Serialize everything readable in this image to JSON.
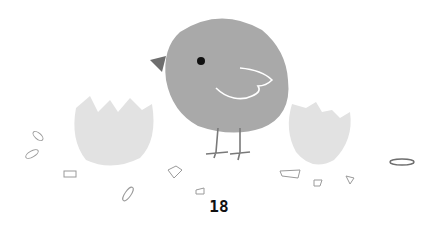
{
  "illustration": {
    "subject": "gray chick with two broken eggshell halves",
    "colors": {
      "chick_body": "#a9a9a9",
      "beak": "#6e6e6e",
      "eye": "#111111",
      "wing_line": "#ffffff",
      "shell": "#e2e2e2",
      "leg": "#7a7a7a",
      "debris": "#9a9a9a"
    }
  },
  "page": {
    "number": "18"
  }
}
